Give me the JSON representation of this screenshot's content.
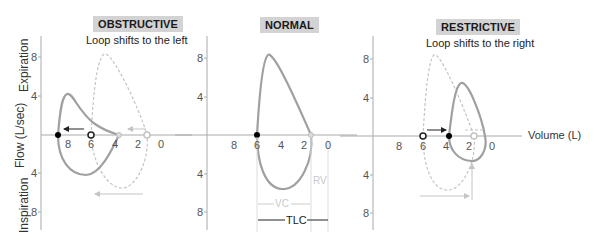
{
  "panels": [
    {
      "id": "obstructive",
      "title": "OBSTRUCTIVE",
      "subtitle": "Loop shifts to the left",
      "y_ticks": [
        "8",
        "4",
        "4",
        "8"
      ],
      "x_ticks": [
        "8",
        "6",
        "4",
        "2",
        "0"
      ]
    },
    {
      "id": "normal",
      "title": "NORMAL",
      "subtitle": "",
      "y_ticks": [
        "8",
        "4",
        "4",
        "8"
      ],
      "x_ticks": [
        "8",
        "6",
        "4",
        "2",
        "0"
      ],
      "annotations": {
        "rv": "RV",
        "vc": "VC",
        "tlc": "TLC"
      }
    },
    {
      "id": "restrictive",
      "title": "RESTRICTIVE",
      "subtitle": "Loop shifts to the right",
      "y_ticks": [
        "8",
        "4",
        "4",
        "8"
      ],
      "x_ticks": [
        "8",
        "6",
        "4",
        "2",
        "0"
      ]
    }
  ],
  "axes": {
    "y_title": "Flow (L/sec)",
    "y_upper": "Expiration",
    "y_lower": "Inspiration",
    "x_title": "Volume (L)"
  },
  "colors": {
    "loop": "#a0a0a0",
    "dashed": "#c4c4c4",
    "axis": "#aaaaaa",
    "badge": "#d3d3d3",
    "marker_filled": "#000000"
  }
}
